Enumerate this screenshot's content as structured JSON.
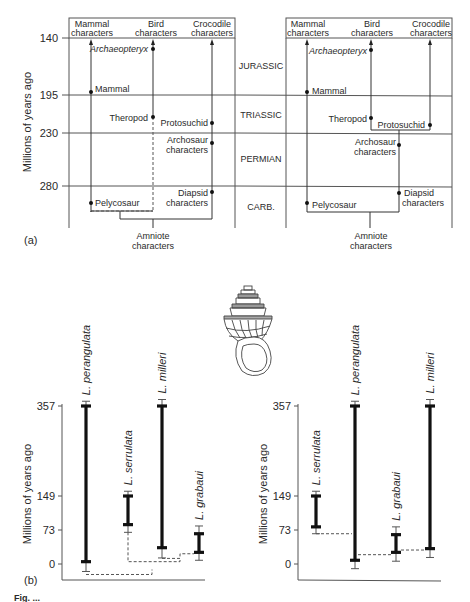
{
  "figure": {
    "panel_a_label": "(a)",
    "panel_b_label": "(b)",
    "caption_fragment": "Fig. ..."
  },
  "chart_data": [
    {
      "type": "diagram",
      "id": "a-left",
      "ylabel": "Millions of years ago",
      "yticks": [
        140,
        195,
        230,
        280
      ],
      "columns": [
        {
          "key": "mammal",
          "line1": "Mammal",
          "line2": "characters"
        },
        {
          "key": "bird",
          "line1": "Bird",
          "line2": "characters"
        },
        {
          "key": "croc",
          "line1": "Crocodile",
          "line2": "characters"
        }
      ],
      "nodes": [
        {
          "label": "Archaeopteryx",
          "italic": true,
          "column": "bird",
          "age": 147,
          "label_side": "left"
        },
        {
          "label": "Mammal",
          "column": "mammal",
          "age": 193,
          "label_side": "right"
        },
        {
          "label": "Theropod",
          "column": "bird",
          "age": 218,
          "label_side": "left"
        },
        {
          "label": "Protosuchid",
          "column": "croc",
          "age": 224,
          "label_side": "left"
        },
        {
          "label": "Archosaur characters",
          "column": "croc",
          "age": 240,
          "label_side": "left"
        },
        {
          "label": "Diapsid characters",
          "column": "croc",
          "age": 284,
          "label_side": "left"
        },
        {
          "label": "Pelycosaur",
          "column": "mammal",
          "age": 300,
          "label_side": "right"
        }
      ],
      "root_label": [
        "Amniote",
        "characters"
      ]
    },
    {
      "type": "diagram",
      "id": "a-right",
      "periods": [
        "JURASSIC",
        "TRIASSIC",
        "PERMIAN",
        "CARB."
      ],
      "columns": [
        {
          "key": "mammal",
          "line1": "Mammal",
          "line2": "characters"
        },
        {
          "key": "bird",
          "line1": "Bird",
          "line2": "characters"
        },
        {
          "key": "croc",
          "line1": "Crocodile",
          "line2": "characters"
        }
      ],
      "nodes": [
        {
          "label": "Archaeopteryx",
          "italic": true,
          "column": "bird",
          "age": 148,
          "label_side": "left"
        },
        {
          "label": "Mammal",
          "column": "mammal",
          "age": 193,
          "label_side": "right"
        },
        {
          "label": "Theropod",
          "column": "bird",
          "age": 218,
          "label_side": "left"
        },
        {
          "label": "Protosuchid",
          "column": "croc",
          "age": 222,
          "label_side": "left"
        },
        {
          "label": "Archosaur characters",
          "column": "archosaur",
          "age": 241,
          "label_side": "left"
        },
        {
          "label": "Diapsid characters",
          "column": "archosaur",
          "age": 284,
          "label_side": "right"
        },
        {
          "label": "Pelycosaur",
          "column": "mammal",
          "age": 296,
          "label_side": "right"
        }
      ],
      "root_label": [
        "Amniote",
        "characters"
      ]
    },
    {
      "type": "range",
      "id": "b-left",
      "ylabel": "Millions of years ago",
      "yticks": [
        0,
        73,
        149,
        357
      ],
      "ylim": [
        -20,
        400
      ],
      "series": [
        {
          "name": "L. perangulata",
          "observed": [
            5,
            357
          ],
          "extended": [
            -8,
            368
          ]
        },
        {
          "name": "L. serrulata",
          "observed": [
            85,
            149
          ],
          "extended": [
            68,
            160
          ]
        },
        {
          "name": "L. milleri",
          "observed": [
            35,
            357
          ],
          "extended": [
            13,
            372
          ]
        },
        {
          "name": "L. grabaui",
          "observed": [
            25,
            65
          ],
          "extended": [
            8,
            82
          ]
        }
      ]
    },
    {
      "type": "range",
      "id": "b-right",
      "ylabel": "Millions of years ago",
      "yticks": [
        0,
        73,
        149,
        357
      ],
      "ylim": [
        -20,
        400
      ],
      "series": [
        {
          "name": "L. serrulata",
          "observed": [
            80,
            149
          ],
          "extended": [
            65,
            160
          ]
        },
        {
          "name": "L. perangulata",
          "observed": [
            8,
            357
          ],
          "extended": [
            -5,
            368
          ]
        },
        {
          "name": "L. grabaui",
          "observed": [
            25,
            63
          ],
          "extended": [
            6,
            80
          ]
        },
        {
          "name": "L. milleri",
          "observed": [
            33,
            357
          ],
          "extended": [
            14,
            372
          ]
        }
      ]
    }
  ]
}
